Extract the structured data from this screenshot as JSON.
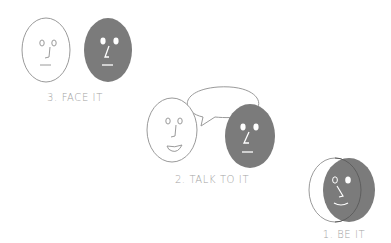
{
  "colors": {
    "background": "#ffffff",
    "outline": "#9a9a9a",
    "face_fill_dark": "#7b7b7b",
    "face_fill_light": "#ffffff",
    "feature_on_dark": "#ffffff",
    "feature_on_light": "#9a9a9a",
    "label_text": "#a3a3a3"
  },
  "steps": [
    {
      "label": "3. FACE IT",
      "description": "A white outlined face and a solid gray face side by side, facing each other"
    },
    {
      "label": "2. TALK TO IT",
      "description": "A smiling white outlined face and a solid gray face sharing one speech bubble"
    },
    {
      "label": "1. BE IT",
      "description": "A white outlined face and a gray face overlapping, merged into one smiling face"
    }
  ]
}
